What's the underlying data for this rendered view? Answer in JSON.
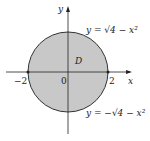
{
  "diagram": {
    "region_label": "D",
    "axis_x_label": "x",
    "axis_y_label": "y",
    "origin_label": "0",
    "tick_left": "−2",
    "tick_right": "2",
    "upper_curve_label": "y = √4 − x²",
    "lower_curve_label": "y = −√4 − x²",
    "fill_color": "#c8c8c8",
    "stroke_color": "#333333"
  }
}
